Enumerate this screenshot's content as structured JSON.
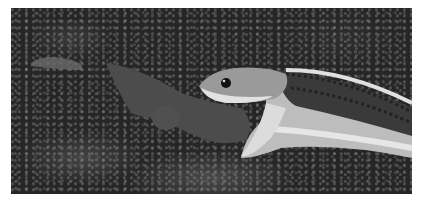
{
  "image": {
    "description": "Grayscale photograph of a garter snake swallowing a salamander on a bed of moss",
    "subjects": [
      "garter snake",
      "salamander",
      "moss"
    ],
    "colors": {
      "background": "#ffffff",
      "moss_dark": "#262626",
      "salamander": "#4c4c4c",
      "snake_stripe": "#d8d8d8",
      "snake_body": "#3a3a3a"
    }
  }
}
